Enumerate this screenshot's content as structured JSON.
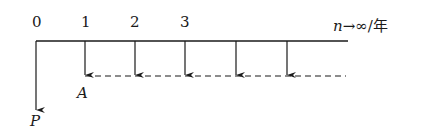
{
  "diagram": {
    "type": "cash-flow-diagram",
    "colors": {
      "ink": "#1a1a1a",
      "background": "#ffffff"
    },
    "ticks": [
      {
        "label": "0",
        "x": 36
      },
      {
        "label": "1",
        "x": 85
      },
      {
        "label": "2",
        "x": 135
      },
      {
        "label": "3",
        "x": 185
      }
    ],
    "axis_label": {
      "variable": "n",
      "arrow": "→",
      "limit": "∞",
      "unit": "/年"
    },
    "annuity_arrows_x": [
      85,
      135,
      185,
      236,
      287
    ],
    "present_value_label": "P",
    "annuity_label": "A"
  }
}
